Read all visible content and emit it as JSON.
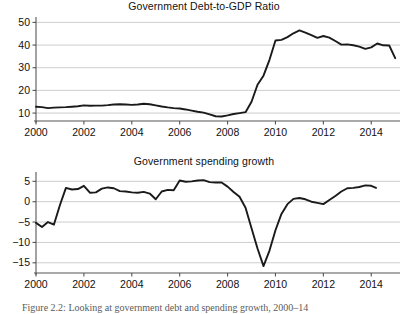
{
  "figure": {
    "caption": "Figure 2.2: Looking at government debt and spending growth, 2000–14"
  },
  "panels": [
    {
      "id": "debt",
      "title": "Government Debt-to-GDP Ratio"
    },
    {
      "id": "spending",
      "title": "Government spending growth"
    }
  ],
  "axis_style": {
    "grid_color": "#c8c8c8",
    "line_color": "#1a1a1a",
    "axis_color": "#555555"
  },
  "chart_data": [
    {
      "type": "line",
      "title": "Government Debt-to-GDP Ratio",
      "xlabel": "",
      "ylabel": "",
      "grid": true,
      "legend": "none",
      "xlim": [
        2000.0,
        2015.2
      ],
      "ylim": [
        6.5,
        51.5
      ],
      "xticks": [
        2000,
        2002,
        2004,
        2006,
        2008,
        2010,
        2012,
        2014
      ],
      "xtick_labels": [
        "2000",
        "2002",
        "2004",
        "2006",
        "2008",
        "2010",
        "2012",
        "2014"
      ],
      "yticks": [
        10,
        20,
        30,
        40,
        50
      ],
      "ytick_labels": [
        "10",
        "20",
        "30",
        "40",
        "50"
      ],
      "series": [
        {
          "name": "Debt-to-GDP ratio",
          "x": [
            2000.0,
            2000.25,
            2000.5,
            2000.75,
            2001.0,
            2001.25,
            2001.5,
            2001.75,
            2002.0,
            2002.25,
            2002.5,
            2002.75,
            2003.0,
            2003.25,
            2003.5,
            2003.75,
            2004.0,
            2004.25,
            2004.5,
            2004.75,
            2005.0,
            2005.25,
            2005.5,
            2005.75,
            2006.0,
            2006.25,
            2006.5,
            2006.75,
            2007.0,
            2007.25,
            2007.5,
            2007.75,
            2008.0,
            2008.25,
            2008.5,
            2008.75,
            2009.0,
            2009.25,
            2009.5,
            2009.75,
            2010.0,
            2010.25,
            2010.5,
            2010.75,
            2011.0,
            2011.25,
            2011.5,
            2011.75,
            2012.0,
            2012.25,
            2012.5,
            2012.75,
            2013.0,
            2013.25,
            2013.5,
            2013.75,
            2014.0,
            2014.25,
            2014.5,
            2014.75,
            2015.0
          ],
          "y": [
            12.8,
            12.6,
            12.2,
            12.4,
            12.5,
            12.6,
            12.8,
            13.0,
            13.4,
            13.2,
            13.3,
            13.3,
            13.5,
            13.8,
            13.9,
            13.8,
            13.6,
            13.8,
            14.1,
            13.9,
            13.4,
            12.9,
            12.5,
            12.2,
            12.0,
            11.6,
            11.1,
            10.6,
            10.2,
            9.4,
            8.6,
            8.5,
            9.0,
            9.6,
            10.0,
            10.4,
            15.0,
            22.5,
            26.5,
            33.5,
            42.0,
            42.3,
            43.5,
            45.2,
            46.5,
            45.5,
            44.4,
            43.2,
            44.0,
            43.3,
            41.8,
            40.2,
            40.3,
            39.9,
            39.3,
            38.3,
            39.0,
            40.7,
            39.9,
            39.8,
            34.2
          ]
        }
      ]
    },
    {
      "type": "line",
      "title": "Government spending growth",
      "xlabel": "",
      "ylabel": "",
      "grid": true,
      "legend": "none",
      "xlim": [
        2000.0,
        2015.2
      ],
      "ylim": [
        -17.5,
        6.8
      ],
      "xticks": [
        2000,
        2002,
        2004,
        2006,
        2008,
        2010,
        2012,
        2014
      ],
      "xtick_labels": [
        "2000",
        "2002",
        "2004",
        "2006",
        "2008",
        "2010",
        "2012",
        "2014"
      ],
      "yticks": [
        -15,
        -10,
        -5,
        0,
        5
      ],
      "ytick_labels": [
        "−15",
        "−10",
        "−5",
        "0",
        "5"
      ],
      "series": [
        {
          "name": "Government spending growth (%)",
          "x": [
            2000.0,
            2000.25,
            2000.5,
            2000.75,
            2001.0,
            2001.25,
            2001.5,
            2001.75,
            2002.0,
            2002.25,
            2002.5,
            2002.75,
            2003.0,
            2003.25,
            2003.5,
            2003.75,
            2004.0,
            2004.25,
            2004.5,
            2004.75,
            2005.0,
            2005.25,
            2005.5,
            2005.75,
            2006.0,
            2006.25,
            2006.5,
            2006.75,
            2007.0,
            2007.25,
            2007.5,
            2007.75,
            2008.0,
            2008.25,
            2008.5,
            2008.75,
            2009.0,
            2009.25,
            2009.5,
            2009.75,
            2010.0,
            2010.25,
            2010.5,
            2010.75,
            2011.0,
            2011.25,
            2011.5,
            2011.75,
            2012.0,
            2012.25,
            2012.5,
            2012.75,
            2013.0,
            2013.25,
            2013.5,
            2013.75,
            2014.0,
            2014.2
          ],
          "y": [
            -5.2,
            -6.2,
            -5.0,
            -5.6,
            -0.8,
            3.4,
            3.0,
            3.1,
            3.9,
            2.2,
            2.3,
            3.2,
            3.5,
            3.3,
            2.6,
            2.5,
            2.3,
            2.2,
            2.4,
            2.0,
            0.6,
            2.5,
            2.9,
            2.8,
            5.2,
            4.9,
            5.0,
            5.2,
            5.3,
            4.8,
            4.7,
            4.7,
            3.7,
            2.4,
            1.2,
            -1.5,
            -6.5,
            -11.5,
            -15.8,
            -12.0,
            -7.0,
            -3.0,
            -0.6,
            0.7,
            0.9,
            0.6,
            0.0,
            -0.3,
            -0.6,
            0.4,
            1.4,
            2.5,
            3.3,
            3.4,
            3.6,
            4.0,
            3.9,
            3.4
          ]
        }
      ]
    }
  ]
}
